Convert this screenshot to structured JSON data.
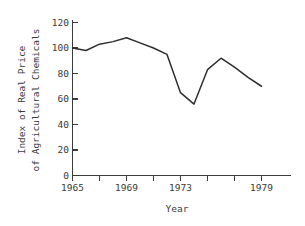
{
  "chart_data": {
    "type": "line",
    "title": "",
    "xlabel": "Year",
    "ylabel": "Index of Real Price of Agricultural Chemicals",
    "ylabel_line1": "Index of Real Price",
    "ylabel_line2": "of Agricultural Chemicals",
    "x": [
      1965,
      1966,
      1967,
      1968,
      1969,
      1970,
      1971,
      1972,
      1973,
      1974,
      1975,
      1976,
      1977,
      1978,
      1979
    ],
    "values": [
      100,
      98,
      103,
      105,
      108,
      104,
      100,
      95,
      65,
      56,
      83,
      92,
      85,
      77,
      70
    ],
    "series": [
      {
        "name": "Index of Real Price of Agricultural Chemicals",
        "values": [
          100,
          98,
          103,
          105,
          108,
          104,
          100,
          95,
          65,
          56,
          83,
          92,
          85,
          77,
          70
        ]
      }
    ],
    "xlim": [
      1965,
      1980
    ],
    "ylim": [
      0,
      120
    ],
    "yticks": [
      0,
      20,
      40,
      60,
      80,
      100,
      120
    ],
    "ytick_labels": [
      "0",
      "20",
      "40",
      "60",
      "80",
      "100",
      "120"
    ],
    "xticks": [
      1965,
      1967,
      1969,
      1971,
      1973,
      1975,
      1977,
      1979
    ],
    "xtick_labels": [
      "1965",
      "",
      "1969",
      "",
      "1973",
      "",
      "",
      "1979"
    ],
    "xtick_labels_shown": [
      "1965",
      "1969",
      "1973",
      "1979"
    ],
    "grid": false,
    "legend": false,
    "line_color": "#2e2e2e",
    "axis_color": "#3a3a3a",
    "background_color": "#ffffff"
  }
}
